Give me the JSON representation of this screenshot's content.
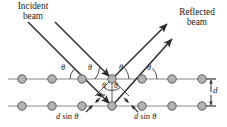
{
  "figure": {
    "name": "bragg-diffraction-diagram",
    "width": 227,
    "height": 127
  },
  "colors": {
    "background": "#ffffff",
    "ray": "#2b2b2b",
    "plane_line": "#8a8a8a",
    "atom_fill": "#b3b3b3",
    "atom_stroke": "#5a5a5a",
    "text": "#1a1a1a",
    "construction": "#4a4a4a"
  },
  "labels": {
    "incident_beam": {
      "line1": "Incident",
      "line2": "beam"
    },
    "reflected_beam": {
      "line1": "Reflected",
      "line2": "beam"
    },
    "theta": "θ",
    "spacing": "d",
    "path_difference_left": {
      "d": "d",
      "sin": "sin",
      "theta": "θ"
    },
    "path_difference_right": {
      "d": "d",
      "sin": "sin",
      "theta": "θ"
    }
  },
  "angles": {
    "top_plane": [
      {
        "id": "theta-top-1",
        "x": 61,
        "y": 68
      },
      {
        "id": "theta-top-2",
        "x": 89,
        "y": 68
      },
      {
        "id": "theta-top-3",
        "x": 119,
        "y": 68
      },
      {
        "id": "theta-top-4",
        "x": 147,
        "y": 68
      }
    ],
    "interior": [
      {
        "id": "theta-inner-left",
        "x": 101,
        "y": 86
      },
      {
        "id": "theta-inner-right",
        "x": 114,
        "y": 86
      }
    ]
  },
  "atoms": {
    "count_per_row": 7,
    "row_top_y": 79,
    "row_bottom_y": 106,
    "x_positions": [
      22,
      52,
      82,
      112,
      142,
      172,
      202
    ],
    "radius": 4.2
  },
  "planes": {
    "top": {
      "y": 79,
      "x_start": 8,
      "x_end": 216
    },
    "bottom": {
      "y": 106,
      "x_start": 8,
      "x_end": 216
    }
  },
  "spacing_marker": {
    "label": "d",
    "x": 211,
    "y_top": 79,
    "y_bottom": 106
  }
}
